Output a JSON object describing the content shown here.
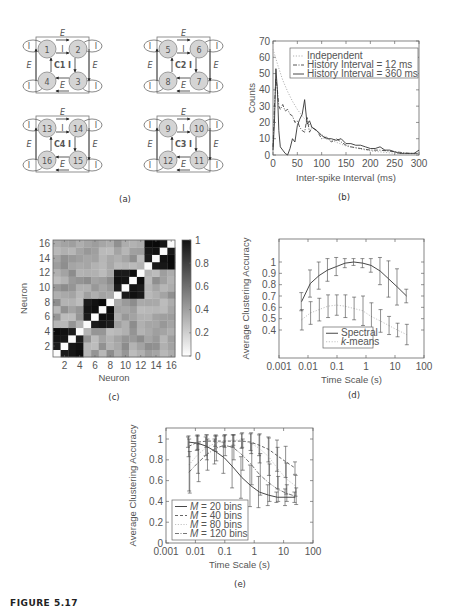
{
  "figure": {
    "caption": "FIGURE 5.17",
    "panels": {
      "a": {
        "label": "(a)"
      },
      "b": {
        "label": "(b)"
      },
      "c": {
        "label": "(c)"
      },
      "d": {
        "label": "(d)"
      },
      "e": {
        "label": "(e)"
      }
    }
  },
  "diagram_a": {
    "clusters": [
      {
        "name": "C1",
        "nodes": [
          "1",
          "2",
          "3",
          "4"
        ],
        "edge_label_outer": "E",
        "edge_label_inner": "I"
      },
      {
        "name": "C2",
        "nodes": [
          "5",
          "6",
          "7",
          "8"
        ],
        "edge_label_outer": "E",
        "edge_label_inner": "I"
      },
      {
        "name": "C4",
        "nodes": [
          "13",
          "14",
          "15",
          "16"
        ],
        "edge_label_outer": "E",
        "edge_label_inner": "I"
      },
      {
        "name": "C3",
        "nodes": [
          "9",
          "10",
          "11",
          "12"
        ],
        "edge_label_outer": "E",
        "edge_label_inner": "I"
      }
    ],
    "self_loop_label": "I"
  },
  "chart_data": [
    {
      "id": "b",
      "type": "line",
      "title": "",
      "xlabel": "Inter-spike Interval (ms)",
      "ylabel": "Counts",
      "xlim": [
        0,
        300
      ],
      "ylim": [
        0,
        70
      ],
      "xticks": [
        0,
        50,
        100,
        150,
        200,
        250,
        300
      ],
      "yticks": [
        0,
        10,
        20,
        30,
        40,
        50,
        60,
        70
      ],
      "legend_position": "upper right",
      "series": [
        {
          "name": "Independent",
          "style": "dotted",
          "x": [
            0,
            10,
            20,
            30,
            40,
            50,
            60,
            80,
            100,
            120,
            150,
            200,
            250,
            300
          ],
          "y": [
            65,
            55,
            46,
            39,
            33,
            28,
            24,
            17,
            12.5,
            9,
            5.5,
            2.5,
            1,
            0.5
          ]
        },
        {
          "name": "History Interval = 12 ms",
          "style": "dashdot",
          "x": [
            0,
            3,
            6,
            9,
            12,
            15,
            20,
            25,
            30,
            35,
            40,
            45,
            50,
            55,
            60,
            65,
            70,
            75,
            80,
            90,
            100,
            110,
            120,
            130,
            140,
            150,
            160,
            180,
            200,
            220,
            250,
            280,
            300
          ],
          "y": [
            5,
            30,
            47,
            40,
            30,
            28,
            31,
            27,
            28,
            25,
            24,
            20,
            21,
            17,
            15,
            14,
            23,
            14,
            17,
            15,
            10,
            11,
            8,
            10,
            8,
            6,
            5,
            4,
            3,
            3,
            2,
            1,
            1
          ]
        },
        {
          "name": "History Interval = 360 ms",
          "style": "solid",
          "x": [
            0,
            3,
            6,
            9,
            12,
            15,
            20,
            25,
            30,
            35,
            40,
            45,
            50,
            55,
            60,
            65,
            70,
            75,
            80,
            90,
            100,
            110,
            120,
            130,
            140,
            150,
            160,
            170,
            180,
            190,
            200,
            210,
            220,
            230,
            240,
            250,
            260,
            270,
            280,
            290,
            300
          ],
          "y": [
            3,
            20,
            53,
            40,
            15,
            5,
            3,
            1,
            0,
            4,
            10,
            8,
            18,
            22,
            25,
            34,
            19,
            21,
            17,
            15,
            12,
            10,
            10,
            9,
            10,
            7,
            7,
            6,
            6,
            5,
            4,
            4,
            5,
            3,
            3,
            2,
            1,
            1,
            1,
            1,
            3
          ]
        }
      ]
    },
    {
      "id": "c",
      "type": "heatmap",
      "title": "",
      "xlabel": "Neuron",
      "ylabel": "Neuron",
      "xticks": [
        2,
        4,
        6,
        8,
        10,
        12,
        14,
        16
      ],
      "yticks": [
        2,
        4,
        6,
        8,
        10,
        12,
        14,
        16
      ],
      "colorbar_ticks": [
        0,
        0.2,
        0.4,
        0.6,
        0.8,
        1
      ],
      "colorbar_range": [
        0,
        1
      ],
      "size": 16,
      "cluster_blocks": [
        [
          1,
          4
        ],
        [
          5,
          8
        ],
        [
          9,
          12
        ],
        [
          13,
          16
        ]
      ],
      "within_cluster_value": 0.9,
      "diagonal_value": 0,
      "between_cluster_value_range": [
        0.25,
        0.45
      ]
    },
    {
      "id": "d",
      "type": "line",
      "title": "",
      "xlabel": "Time Scale (s)",
      "ylabel": "Average Clustering Accuracy",
      "xscale": "log",
      "xlim": [
        0.001,
        100
      ],
      "ylim": [
        0.2,
        1.1
      ],
      "xticks": [
        "0.001",
        "0.01",
        "0.1",
        "1",
        "10",
        "100"
      ],
      "yticks": [
        0.4,
        0.5,
        0.6,
        0.7,
        0.8,
        0.9,
        1
      ],
      "legend_position": "lower center",
      "x": [
        0.006,
        0.012,
        0.024,
        0.048,
        0.096,
        0.19,
        0.38,
        0.77,
        1.5,
        3.1,
        6.1,
        12,
        25
      ],
      "series": [
        {
          "name": "Spectral",
          "style": "solid",
          "y": [
            0.65,
            0.81,
            0.88,
            0.93,
            0.96,
            0.99,
            1.0,
            0.99,
            0.97,
            0.92,
            0.85,
            0.78,
            0.7
          ],
          "err": [
            0.08,
            0.12,
            0.12,
            0.1,
            0.08,
            0.04,
            0.03,
            0.04,
            0.06,
            0.12,
            0.16,
            0.16,
            0.06
          ]
        },
        {
          "name": "k-means",
          "style": "dotted",
          "y": [
            0.49,
            0.55,
            0.58,
            0.61,
            0.62,
            0.61,
            0.59,
            0.57,
            0.52,
            0.48,
            0.44,
            0.4,
            0.36
          ],
          "err": [
            0.09,
            0.1,
            0.1,
            0.1,
            0.09,
            0.1,
            0.1,
            0.13,
            0.12,
            0.1,
            0.08,
            0.06,
            0.09
          ]
        }
      ]
    },
    {
      "id": "e",
      "type": "line",
      "title": "",
      "xlabel": "Time Scale (s)",
      "ylabel": "Average Clustering Accuracy",
      "xscale": "log",
      "xlim": [
        0.001,
        100
      ],
      "ylim": [
        0,
        1.1
      ],
      "xticks": [
        "0.001",
        "0.01",
        "0.1",
        "1",
        "10",
        "100"
      ],
      "yticks": [
        0,
        0.2,
        0.4,
        0.6,
        0.8,
        1
      ],
      "legend_position": "lower left",
      "x": [
        0.006,
        0.012,
        0.024,
        0.048,
        0.096,
        0.19,
        0.38,
        0.77,
        1.5,
        3.1,
        6.1,
        12,
        25
      ],
      "series": [
        {
          "name": "M = 20 bins",
          "style": "solid",
          "y": [
            0.97,
            0.96,
            0.93,
            0.88,
            0.82,
            0.73,
            0.63,
            0.55,
            0.49,
            0.46,
            0.44,
            0.44,
            0.44
          ],
          "err": [
            0.05,
            0.07,
            0.09,
            0.12,
            0.15,
            0.2,
            0.2,
            0.2,
            0.15,
            0.1,
            0.05,
            0.08,
            0.05
          ]
        },
        {
          "name": "M = 40 bins",
          "style": "dashed",
          "y": [
            0.93,
            0.97,
            0.98,
            0.98,
            0.98,
            0.98,
            0.98,
            0.97,
            0.94,
            0.9,
            0.84,
            0.78,
            0.72
          ],
          "err": [
            0.1,
            0.07,
            0.06,
            0.05,
            0.05,
            0.06,
            0.07,
            0.08,
            0.1,
            0.12,
            0.15,
            0.15,
            0.06
          ]
        },
        {
          "name": "M = 80 bins",
          "style": "dotted",
          "y": [
            0.75,
            0.85,
            0.92,
            0.96,
            0.98,
            0.99,
            0.99,
            0.96,
            0.91,
            0.83,
            0.72,
            0.62,
            0.55
          ],
          "err": [
            0.25,
            0.18,
            0.12,
            0.08,
            0.06,
            0.05,
            0.07,
            0.1,
            0.14,
            0.18,
            0.2,
            0.15,
            0.1
          ]
        },
        {
          "name": "M = 120 bins",
          "style": "dashdot",
          "y": [
            0.68,
            0.77,
            0.85,
            0.91,
            0.94,
            0.92,
            0.85,
            0.76,
            0.66,
            0.58,
            0.52,
            0.48,
            0.45
          ],
          "err": [
            0.2,
            0.18,
            0.15,
            0.12,
            0.1,
            0.12,
            0.15,
            0.2,
            0.2,
            0.18,
            0.12,
            0.08,
            0.08
          ]
        }
      ]
    }
  ]
}
